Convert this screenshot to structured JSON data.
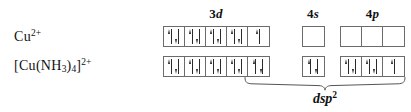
{
  "figure": {
    "type": "orbital-box-diagram",
    "headers": [
      {
        "shell": "3",
        "orbital": "d",
        "name": "3d"
      },
      {
        "shell": "4",
        "orbital": "s",
        "name": "4s"
      },
      {
        "shell": "4",
        "orbital": "p",
        "name": "4p"
      }
    ],
    "rows": [
      {
        "id": "cu2plus",
        "label_text": "Cu",
        "label_charge": "2+",
        "label_full": "Cu 2+",
        "orbitals": {
          "3d": [
            "pair",
            "pair",
            "pair",
            "pair",
            "up"
          ],
          "4s": [
            "empty"
          ],
          "4p": [
            "empty",
            "empty",
            "empty"
          ]
        }
      },
      {
        "id": "cu-nh3-4-2plus",
        "label_prefix": "[Cu(NH",
        "label_sub1": "3",
        "label_mid": ")",
        "label_sub2": "4",
        "label_suffix": "]",
        "label_charge": "2+",
        "label_full": "[Cu(NH3)4]2+",
        "orbitals": {
          "3d": [
            "pair",
            "pair",
            "pair",
            "pair",
            "pair"
          ],
          "4s": [
            "pair"
          ],
          "4p": [
            "pair",
            "pair",
            "up"
          ]
        }
      }
    ],
    "hybridization": {
      "label_base": "dsp",
      "label_exponent": "2",
      "label_full": "dsp2",
      "spans_from": "3d-last-orbital",
      "spans_to": "4p-last-orbital"
    },
    "colors": {
      "box_border": "#6b6b6b",
      "arrow": "#2a2a2a",
      "text": "#111111",
      "background": "#ffffff",
      "brace": "#555555"
    }
  }
}
